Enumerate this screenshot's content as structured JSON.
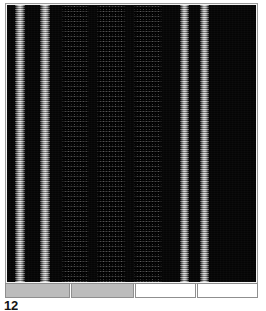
{
  "figure": {
    "caption": "12",
    "caption_clipped": true,
    "background_color": "#ffffff"
  },
  "panel": {
    "name": "lane-image-panel",
    "background_color": "#050505",
    "frame_color": "#9a9a9a",
    "x": 5,
    "y": 3,
    "width": 253,
    "height": 281
  },
  "bands": [
    {
      "id": "band-1",
      "kind": "bright",
      "left": 8,
      "width": 10,
      "intensity": "high",
      "color": "#bdbdbd"
    },
    {
      "id": "band-2",
      "kind": "bright",
      "left": 33,
      "width": 10,
      "intensity": "high",
      "color": "#c2c2c2"
    },
    {
      "id": "band-3",
      "kind": "speckle",
      "left": 55,
      "width": 28,
      "intensity": "low",
      "color": "#2a2a2a"
    },
    {
      "id": "band-4",
      "kind": "speckle",
      "left": 91,
      "width": 29,
      "intensity": "low",
      "color": "#2c2c2c"
    },
    {
      "id": "band-5",
      "kind": "speckle",
      "left": 128,
      "width": 28,
      "intensity": "low",
      "color": "#292929"
    },
    {
      "id": "band-6",
      "kind": "bright",
      "left": 174,
      "width": 9,
      "intensity": "high",
      "color": "#bababa"
    },
    {
      "id": "band-7",
      "kind": "bright",
      "left": 195,
      "width": 9,
      "intensity": "high",
      "color": "#b8b8b8"
    }
  ],
  "bottom_bar": {
    "name": "lane-legend-bar",
    "segments": [
      {
        "id": "segment-1",
        "fill": "#bcbcbc",
        "flex": 66,
        "label": ""
      },
      {
        "id": "segment-2",
        "fill": "#bcbcbc",
        "flex": 64,
        "label": ""
      },
      {
        "id": "segment-3",
        "fill": "#ffffff",
        "flex": 61,
        "label": ""
      },
      {
        "id": "segment-4",
        "fill": "#ffffff",
        "flex": 62,
        "label": ""
      }
    ]
  },
  "colors": {
    "page_background": "#ffffff",
    "panel_dark": "#050505",
    "band_bright": "#c0c0c0",
    "band_dim": "#2b2b2b",
    "segment_gray": "#bcbcbc",
    "segment_white": "#ffffff",
    "frame_border": "#9a9a9a",
    "caption_text": "#151515"
  }
}
